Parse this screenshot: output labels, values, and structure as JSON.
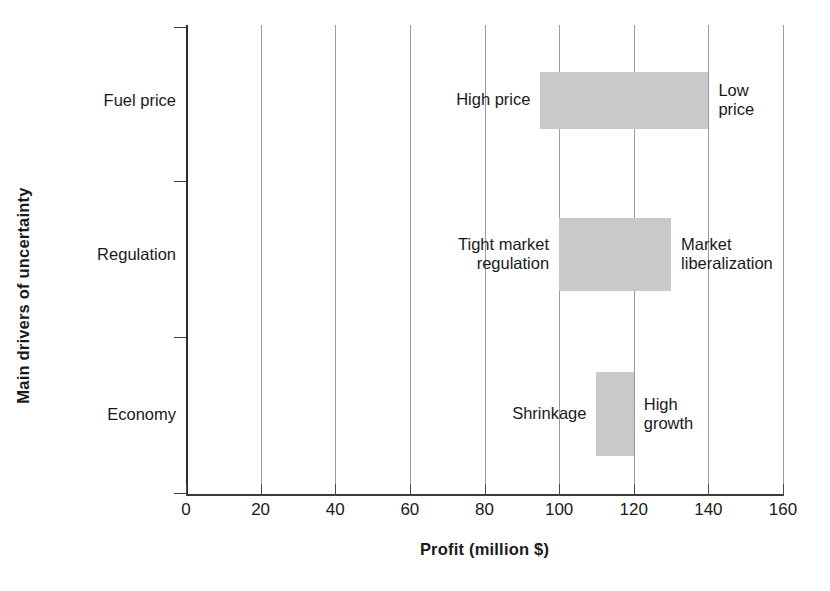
{
  "chart_data": {
    "type": "bar",
    "chart_subtype": "tornado-range-bar",
    "title": "",
    "xlabel": "Profit (million $)",
    "ylabel": "Main drivers of uncertainty",
    "xlim": [
      0,
      160
    ],
    "xticks": [
      0,
      20,
      40,
      60,
      80,
      100,
      120,
      140,
      160
    ],
    "xtick_labels": [
      "0",
      "20",
      "40",
      "60",
      "80",
      "100",
      "120",
      "140",
      "160"
    ],
    "categories": [
      "Fuel price",
      "Regulation",
      "Economy"
    ],
    "grid": "vertical",
    "legend": "none",
    "bar_color": "#c9c9c9",
    "bars": [
      {
        "category": "Fuel price",
        "low": 95,
        "high": 140,
        "low_label": "High price",
        "high_label": "Low\nprice"
      },
      {
        "category": "Regulation",
        "low": 100,
        "high": 130,
        "low_label": "Tight market\nregulation",
        "high_label": "Market\nliberalization"
      },
      {
        "category": "Economy",
        "low": 110,
        "high": 120,
        "low_label": "Shrinkage",
        "high_label": "High\ngrowth"
      }
    ],
    "annotations": [
      "High price",
      "Low price",
      "Tight market regulation",
      "Market liberalization",
      "Shrinkage",
      "High growth"
    ]
  }
}
